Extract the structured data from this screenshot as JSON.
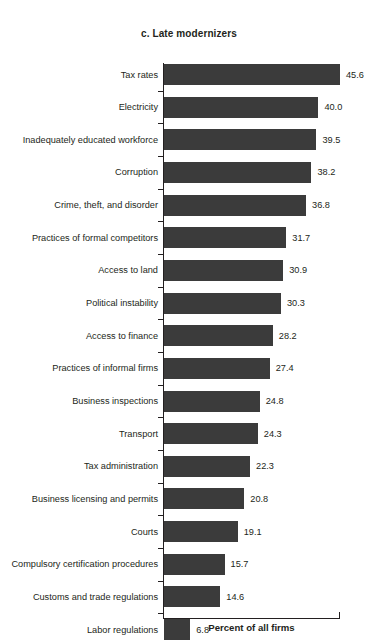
{
  "chart_data": {
    "type": "bar",
    "orientation": "horizontal",
    "title": "c. Late modernizers",
    "xlabel": "Percent of all firms",
    "ylabel": "",
    "grid": false,
    "legend": null,
    "xlim": [
      0,
      45.6
    ],
    "categories": [
      "Tax rates",
      "Electricity",
      "Inadequately educated workforce",
      "Corruption",
      "Crime, theft, and disorder",
      "Practices of formal competitors",
      "Access to land",
      "Political instability",
      "Access to finance",
      "Practices of informal firms",
      "Business inspections",
      "Transport",
      "Tax administration",
      "Business licensing and permits",
      "Courts",
      "Compulsory certification procedures",
      "Customs and trade regulations",
      "Labor regulations"
    ],
    "values": [
      45.6,
      40.0,
      39.5,
      38.2,
      36.8,
      31.7,
      30.9,
      30.3,
      28.2,
      27.4,
      24.8,
      24.3,
      22.3,
      20.8,
      19.1,
      15.7,
      14.6,
      6.8
    ],
    "value_labels": [
      "45.6",
      "40.0",
      "39.5",
      "38.2",
      "36.8",
      "31.7",
      "30.9",
      "30.3",
      "28.2",
      "27.4",
      "24.8",
      "24.3",
      "22.3",
      "20.8",
      "19.1",
      "15.7",
      "14.6",
      "6.8"
    ],
    "bar_color": "#3b3b3b",
    "background_color": "#ffffff",
    "axis_color": "#231f20"
  }
}
